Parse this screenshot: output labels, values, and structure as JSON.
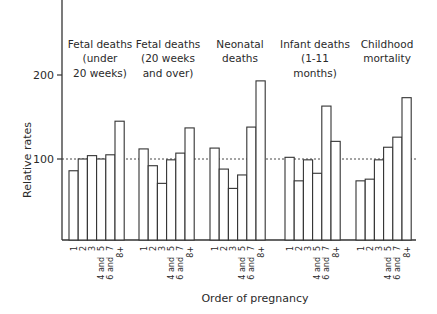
{
  "chart_data": {
    "type": "bar",
    "title": "",
    "xlabel": "Order of pregnancy",
    "ylabel": "Relative rates",
    "ylim": [
      0,
      290
    ],
    "yticks": [
      100,
      200
    ],
    "reference_line": {
      "value": 100,
      "style": "dashed"
    },
    "grid": false,
    "legend": null,
    "categories": [
      "1",
      "2",
      "3",
      "4 and 5",
      "6 and 7",
      "8+"
    ],
    "groups": [
      {
        "name": "Fetal deaths (under 20 weeks)",
        "label_lines": [
          "Fetal deaths",
          "(under",
          "20 weeks)"
        ],
        "values": [
          86,
          100,
          104,
          100,
          105,
          145
        ]
      },
      {
        "name": "Fetal deaths (20 weeks and over)",
        "label_lines": [
          "Fetal deaths",
          "(20 weeks",
          "and over)"
        ],
        "values": [
          112,
          92,
          71,
          99,
          107,
          137
        ]
      },
      {
        "name": "Neonatal deaths",
        "label_lines": [
          "Neonatal",
          "deaths"
        ],
        "values": [
          113,
          88,
          65,
          81,
          138,
          193
        ]
      },
      {
        "name": "Infant deaths (1-11 months)",
        "label_lines": [
          "Infant deaths",
          "(1-11",
          "months)"
        ],
        "values": [
          102,
          74,
          99,
          83,
          163,
          121
        ]
      },
      {
        "name": "Childhood mortality",
        "label_lines": [
          "Childhood",
          "mortality"
        ],
        "values": [
          74,
          76,
          99,
          114,
          126,
          173
        ]
      }
    ],
    "tick_labels": [
      {
        "main": "1",
        "sub": ""
      },
      {
        "main": "2",
        "sub": ""
      },
      {
        "main": "3",
        "sub": ""
      },
      {
        "main": "5",
        "sub": "4 and"
      },
      {
        "main": "7",
        "sub": "6 and"
      },
      {
        "main": "8+",
        "sub": ""
      }
    ]
  }
}
